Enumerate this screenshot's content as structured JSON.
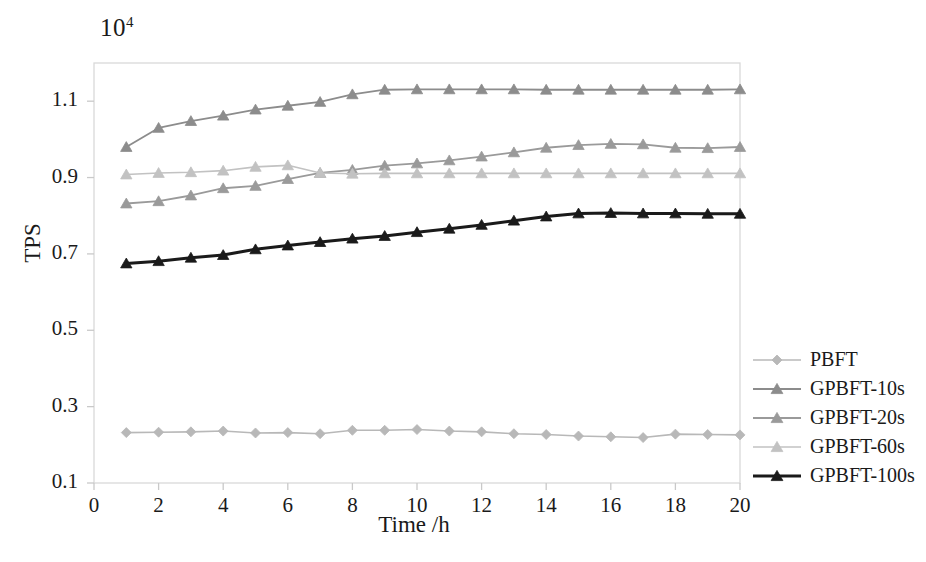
{
  "chart_data": {
    "type": "line",
    "title": "",
    "xlabel": "Time /h",
    "ylabel": "TPS",
    "y_exponent_base": "10",
    "y_exponent_power": "4",
    "x": [
      1,
      2,
      3,
      4,
      5,
      6,
      7,
      8,
      9,
      10,
      11,
      12,
      13,
      14,
      15,
      16,
      17,
      18,
      19,
      20
    ],
    "xlim": [
      0,
      20
    ],
    "ylim": [
      0.1,
      1.2
    ],
    "x_ticks": [
      "0",
      "2",
      "4",
      "6",
      "8",
      "10",
      "12",
      "14",
      "16",
      "18",
      "20"
    ],
    "x_tick_values": [
      0,
      2,
      4,
      6,
      8,
      10,
      12,
      14,
      16,
      18,
      20
    ],
    "y_ticks": [
      "0.1",
      "0.3",
      "0.5",
      "0.7",
      "0.9",
      "1.1"
    ],
    "y_tick_values": [
      0.1,
      0.3,
      0.5,
      0.7,
      0.9,
      1.1
    ],
    "grid": false,
    "legend_position": "right",
    "series": [
      {
        "name": "PBFT",
        "color": "#b8b8b8",
        "marker": "diamond",
        "linewidth": 1.6,
        "values": [
          0.232,
          0.233,
          0.234,
          0.236,
          0.231,
          0.232,
          0.229,
          0.238,
          0.238,
          0.24,
          0.236,
          0.234,
          0.229,
          0.227,
          0.223,
          0.221,
          0.219,
          0.228,
          0.227,
          0.226
        ]
      },
      {
        "name": "GPBFT-10s",
        "color": "#8c8c8c",
        "marker": "triangle",
        "linewidth": 1.8,
        "values": [
          0.98,
          1.03,
          1.048,
          1.062,
          1.078,
          1.088,
          1.098,
          1.118,
          1.13,
          1.131,
          1.131,
          1.131,
          1.131,
          1.13,
          1.13,
          1.13,
          1.13,
          1.13,
          1.13,
          1.131
        ]
      },
      {
        "name": "GPBFT-20s",
        "color": "#9a9a9a",
        "marker": "triangle",
        "linewidth": 1.8,
        "values": [
          0.832,
          0.838,
          0.853,
          0.872,
          0.878,
          0.896,
          0.912,
          0.92,
          0.931,
          0.937,
          0.945,
          0.955,
          0.966,
          0.978,
          0.985,
          0.988,
          0.987,
          0.978,
          0.977,
          0.98
        ]
      },
      {
        "name": "GPBFT-60s",
        "color": "#c2c2c2",
        "marker": "triangle",
        "linewidth": 1.6,
        "values": [
          0.908,
          0.912,
          0.914,
          0.918,
          0.928,
          0.932,
          0.912,
          0.91,
          0.911,
          0.911,
          0.911,
          0.911,
          0.911,
          0.911,
          0.911,
          0.911,
          0.911,
          0.911,
          0.911,
          0.911
        ]
      },
      {
        "name": "GPBFT-100s",
        "color": "#1a1a1a",
        "marker": "triangle",
        "linewidth": 3.0,
        "values": [
          0.675,
          0.681,
          0.69,
          0.697,
          0.712,
          0.722,
          0.731,
          0.74,
          0.747,
          0.757,
          0.766,
          0.776,
          0.787,
          0.798,
          0.806,
          0.807,
          0.806,
          0.806,
          0.805,
          0.805
        ]
      }
    ]
  },
  "plot_frame": {
    "left": 94,
    "top": 63,
    "right": 740,
    "bottom": 483,
    "border_color": "#d9d9d9"
  }
}
